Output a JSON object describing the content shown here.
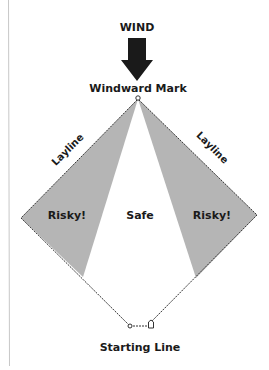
{
  "diagram": {
    "title": "WIND",
    "labels": {
      "windward_mark": "Windward Mark",
      "layline_left": "Layline",
      "layline_right": "Layline",
      "risky_left": "Risky!",
      "safe": "Safe",
      "risky_right": "Risky!",
      "starting_line": "Starting Line"
    },
    "colors": {
      "risky_fill": "#b5b5b5",
      "line": "#333333",
      "text": "#1a1a1a",
      "arrow": "#1a1a1a"
    }
  }
}
